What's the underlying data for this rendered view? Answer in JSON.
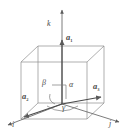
{
  "figure": {
    "name": "crystal-unit-cell-axes-diagram",
    "background_color": "#ffffff",
    "line_color": "#6e6e6e",
    "text_color": "#4a4a4a"
  },
  "axes": [
    {
      "id": "k",
      "label": "k",
      "description": "vertical axis pointing up"
    },
    {
      "id": "i",
      "label": "i",
      "description": "axis pointing to lower left"
    },
    {
      "id": "j",
      "label": "j",
      "description": "axis pointing to lower right"
    }
  ],
  "vectors": [
    {
      "id": "a1",
      "symbol": "a",
      "subscript": "1",
      "description": "lattice vector along vertical k direction"
    },
    {
      "id": "a2",
      "symbol": "a",
      "subscript": "2",
      "description": "lattice vector toward lower left along i"
    },
    {
      "id": "a3",
      "symbol": "a",
      "subscript": "3",
      "description": "lattice vector toward right along j"
    }
  ],
  "angles": [
    {
      "id": "alpha",
      "label": "α",
      "description": "angle between a1 and a3"
    },
    {
      "id": "beta",
      "label": "β",
      "description": "angle between a1 and a2"
    },
    {
      "id": "gamma",
      "label": "γ",
      "description": "angle between a2 and a3"
    }
  ],
  "shapes": {
    "cube": "wireframe cube drawn in thin grey lines",
    "right_angle_marker": "small square at origin indicating right angle"
  }
}
